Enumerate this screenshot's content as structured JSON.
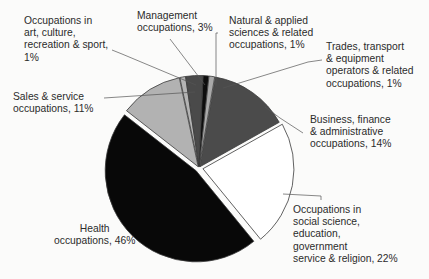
{
  "chart_data": {
    "type": "pie",
    "title": "",
    "slices": [
      {
        "label": "Occupations in art, culture, recreation & sport",
        "value": 1,
        "color": "#b4b4b4"
      },
      {
        "label": "Management occupations",
        "value": 3,
        "color": "#4a4a4a"
      },
      {
        "label": "Natural & applied sciences & related occupations",
        "value": 1,
        "color": "#0d0d0d"
      },
      {
        "label": "Trades, transport & equipment operators & related occupations",
        "value": 1,
        "color": "#a9a9a9"
      },
      {
        "label": "Business, finance & administrative occupations",
        "value": 14,
        "color": "#4b4b4b"
      },
      {
        "label": "Occupations in social science, education, government service & religion",
        "value": 22,
        "color": "#ffffff"
      },
      {
        "label": "Health occupations",
        "value": 46,
        "color": "#080808"
      },
      {
        "label": "Sales & service occupations",
        "value": 11,
        "color": "#b2b2b2"
      }
    ],
    "legend": "none (callout labels)"
  },
  "labels": {
    "art": "Occupations in\nart, culture,\nrecreation & sport,\n1%",
    "management": "Management\noccupations, 3%",
    "natural": "Natural & applied\nsciences & related\noccupations, 1%",
    "trades": "Trades, transport\n& equipment\noperators & related\noccupations, 1%",
    "business": "Business, finance\n& administrative\noccupations, 14%",
    "social": "Occupations in\nsocial science,\neducation,\ngovernment\nservice & religion, 22%",
    "health": "Health\noccupations, 46%",
    "sales": "Sales & service\noccupations, 11%"
  }
}
